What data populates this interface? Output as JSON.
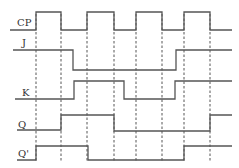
{
  "diagram": {
    "type": "timing-diagram",
    "signals": [
      {
        "name": "CP",
        "label_x": 17,
        "label_y": 26,
        "path": "M10 30 H36 V12 H61 V30 H87 V12 H114 V30 H136 V12 H162 V30 H184 V12 H210 V30 H232"
      },
      {
        "name": "J",
        "label_x": 22,
        "label_y": 46,
        "path": "M13 50 H73 V70 H176 V50 H232"
      },
      {
        "name": "K",
        "label_x": 22,
        "label_y": 96,
        "path": "M15 99 H74 V81 H124 V99 H175 V81 H232"
      },
      {
        "name": "Q",
        "label_x": 18,
        "label_y": 128,
        "path": "M17 130 H61 V115 H114 V131 H210 V115 H232"
      },
      {
        "name": "Q'",
        "label_x": 18,
        "label_y": 157,
        "path": "M17 160 H36 V146 H88 V160 H184 V146 H232"
      }
    ],
    "clock_edges_x": [
      36,
      61,
      87,
      114,
      136,
      162,
      184,
      210
    ],
    "dashed_top_y": 14,
    "dashed_bottom_y": 162,
    "colors": {
      "line": "#555555",
      "text": "#333333",
      "background": "#ffffff"
    }
  }
}
